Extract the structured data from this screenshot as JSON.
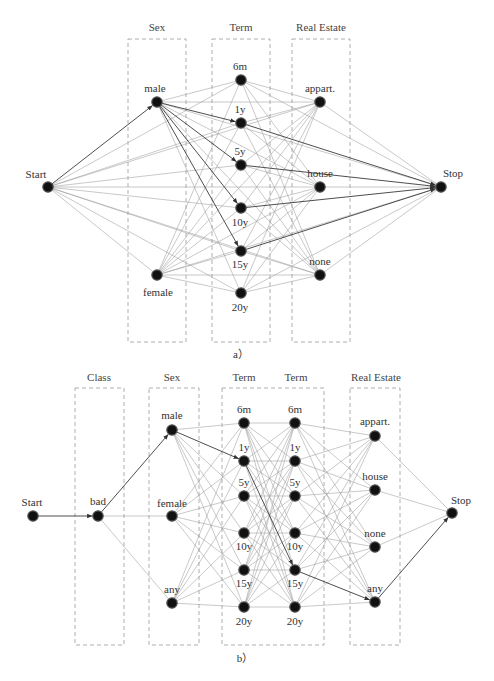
{
  "figure": {
    "panels": [
      {
        "id": "a",
        "caption": "a）",
        "caption_pos": [
          241,
          358
        ],
        "groups": [
          {
            "label": "Sex",
            "x": 128,
            "y": 39,
            "w": 58,
            "h": 303,
            "label_x": 157,
            "label_y": 31
          },
          {
            "label": "Term",
            "x": 212,
            "y": 39,
            "w": 58,
            "h": 303,
            "label_x": 241,
            "label_y": 31
          },
          {
            "label": "Real Estate",
            "x": 292,
            "y": 39,
            "w": 58,
            "h": 303,
            "label_x": 321,
            "label_y": 31
          }
        ],
        "nodes": [
          {
            "id": "start",
            "label": "Start",
            "x": 48,
            "y": 187,
            "lx": 36,
            "ly": 178,
            "layer": 0
          },
          {
            "id": "male",
            "label": "male",
            "x": 157,
            "y": 102,
            "lx": 155,
            "ly": 92,
            "layer": 1
          },
          {
            "id": "female",
            "label": "female",
            "x": 157,
            "y": 275,
            "lx": 158,
            "ly": 296,
            "layer": 1
          },
          {
            "id": "t6m",
            "label": "6m",
            "x": 241,
            "y": 80,
            "lx": 240,
            "ly": 70,
            "layer": 2
          },
          {
            "id": "t1y",
            "label": "1y",
            "x": 241,
            "y": 123,
            "lx": 240,
            "ly": 113,
            "layer": 2
          },
          {
            "id": "t5y",
            "label": "5y",
            "x": 241,
            "y": 165,
            "lx": 240,
            "ly": 155,
            "layer": 2
          },
          {
            "id": "t10y",
            "label": "10y",
            "x": 241,
            "y": 208,
            "lx": 240,
            "ly": 226,
            "layer": 2
          },
          {
            "id": "t15y",
            "label": "15y",
            "x": 241,
            "y": 251,
            "lx": 240,
            "ly": 268,
            "layer": 2
          },
          {
            "id": "t20y",
            "label": "20y",
            "x": 241,
            "y": 293,
            "lx": 240,
            "ly": 311,
            "layer": 2
          },
          {
            "id": "appart",
            "label": "appart.",
            "x": 320,
            "y": 102,
            "lx": 320,
            "ly": 92,
            "layer": 3
          },
          {
            "id": "house",
            "label": "house",
            "x": 320,
            "y": 187,
            "lx": 320,
            "ly": 177,
            "layer": 3
          },
          {
            "id": "none",
            "label": "none",
            "x": 320,
            "y": 275,
            "lx": 320,
            "ly": 265,
            "layer": 3
          },
          {
            "id": "stop",
            "label": "Stop",
            "x": 441,
            "y": 187,
            "lx": 453,
            "ly": 177,
            "layer": 4
          }
        ],
        "highlight": [
          [
            "start",
            "male"
          ],
          [
            "male",
            "t1y"
          ],
          [
            "male",
            "t5y"
          ],
          [
            "male",
            "t10y"
          ],
          [
            "male",
            "t15y"
          ],
          [
            "t1y",
            "stop"
          ],
          [
            "t5y",
            "stop"
          ],
          [
            "t10y",
            "stop"
          ],
          [
            "t15y",
            "stop"
          ]
        ],
        "connect": [
          [
            0,
            1
          ],
          [
            0,
            2
          ],
          [
            0,
            3
          ],
          [
            1,
            2
          ],
          [
            1,
            3
          ],
          [
            1,
            4
          ],
          [
            2,
            3
          ],
          [
            2,
            4
          ],
          [
            3,
            4
          ]
        ]
      },
      {
        "id": "b",
        "caption": "b）",
        "caption_pos": [
          245,
          662
        ],
        "groups": [
          {
            "label": "Class",
            "x": 75,
            "y": 388,
            "w": 49,
            "h": 257,
            "label_x": 99,
            "label_y": 381
          },
          {
            "label": "Sex",
            "x": 149,
            "y": 388,
            "w": 50,
            "h": 257,
            "label_x": 172,
            "label_y": 381
          },
          {
            "label": "Term",
            "x": 222,
            "y": 388,
            "w": 102,
            "h": 257,
            "label_x": 244,
            "label_y": 381
          },
          {
            "label": "Term",
            "x": null,
            "y": null,
            "w": null,
            "h": null,
            "label_x": 296,
            "label_y": 381
          },
          {
            "label": "Real Estate",
            "x": 350,
            "y": 388,
            "w": 50,
            "h": 257,
            "label_x": 376,
            "label_y": 381
          }
        ],
        "nodes": [
          {
            "id": "start",
            "label": "Start",
            "x": 33,
            "y": 516,
            "lx": 32,
            "ly": 506,
            "layer": 0
          },
          {
            "id": "bad",
            "label": "bad",
            "x": 98,
            "y": 516,
            "lx": 98,
            "ly": 505,
            "layer": 1
          },
          {
            "id": "male",
            "label": "male",
            "x": 172,
            "y": 430,
            "lx": 172,
            "ly": 419,
            "layer": 2
          },
          {
            "id": "female",
            "label": "female",
            "x": 172,
            "y": 516,
            "lx": 172,
            "ly": 507,
            "layer": 2
          },
          {
            "id": "any_s",
            "label": "any",
            "x": 172,
            "y": 603,
            "lx": 172,
            "ly": 593,
            "layer": 2
          },
          {
            "id": "a6m",
            "label": "6m",
            "x": 244,
            "y": 423,
            "lx": 244,
            "ly": 413,
            "layer": 3
          },
          {
            "id": "a1y",
            "label": "1y",
            "x": 244,
            "y": 461,
            "lx": 244,
            "ly": 451,
            "layer": 3
          },
          {
            "id": "a5y",
            "label": "5y",
            "x": 244,
            "y": 496,
            "lx": 244,
            "ly": 486,
            "layer": 3
          },
          {
            "id": "a10y",
            "label": "10y",
            "x": 244,
            "y": 533,
            "lx": 244,
            "ly": 550,
            "layer": 3
          },
          {
            "id": "a15y",
            "label": "15y",
            "x": 244,
            "y": 570,
            "lx": 244,
            "ly": 587,
            "layer": 3
          },
          {
            "id": "a20y",
            "label": "20y",
            "x": 244,
            "y": 607,
            "lx": 244,
            "ly": 625,
            "layer": 3
          },
          {
            "id": "b6m",
            "label": "6m",
            "x": 295,
            "y": 423,
            "lx": 295,
            "ly": 413,
            "layer": 4
          },
          {
            "id": "b1y",
            "label": "1y",
            "x": 295,
            "y": 461,
            "lx": 295,
            "ly": 451,
            "layer": 4
          },
          {
            "id": "b5y",
            "label": "5y",
            "x": 295,
            "y": 496,
            "lx": 295,
            "ly": 486,
            "layer": 4
          },
          {
            "id": "b10y",
            "label": "10y",
            "x": 295,
            "y": 533,
            "lx": 295,
            "ly": 550,
            "layer": 4
          },
          {
            "id": "b15y",
            "label": "15y",
            "x": 295,
            "y": 570,
            "lx": 295,
            "ly": 587,
            "layer": 4
          },
          {
            "id": "b20y",
            "label": "20y",
            "x": 295,
            "y": 607,
            "lx": 295,
            "ly": 625,
            "layer": 4
          },
          {
            "id": "appart",
            "label": "appart.",
            "x": 375,
            "y": 436,
            "lx": 375,
            "ly": 425,
            "layer": 5
          },
          {
            "id": "house",
            "label": "house",
            "x": 375,
            "y": 490,
            "lx": 375,
            "ly": 480,
            "layer": 5
          },
          {
            "id": "none",
            "label": "none",
            "x": 375,
            "y": 547,
            "lx": 375,
            "ly": 537,
            "layer": 5
          },
          {
            "id": "any_r",
            "label": "any",
            "x": 375,
            "y": 602,
            "lx": 375,
            "ly": 592,
            "layer": 5
          },
          {
            "id": "stop",
            "label": "Stop",
            "x": 452,
            "y": 513,
            "lx": 461,
            "ly": 504,
            "layer": 6
          }
        ],
        "highlight": [
          [
            "start",
            "bad"
          ],
          [
            "bad",
            "male"
          ],
          [
            "male",
            "a1y"
          ],
          [
            "a1y",
            "b15y"
          ],
          [
            "b15y",
            "any_r"
          ],
          [
            "any_r",
            "stop"
          ]
        ],
        "connect": [
          [
            0,
            1
          ],
          [
            1,
            2
          ],
          [
            2,
            3
          ],
          [
            3,
            4
          ],
          [
            4,
            5
          ],
          [
            5,
            6
          ]
        ]
      }
    ]
  }
}
